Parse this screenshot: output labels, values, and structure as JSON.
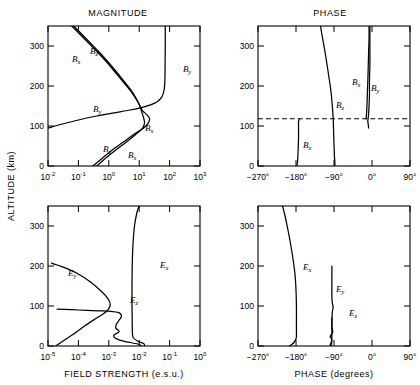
{
  "figure": {
    "panel_titles": {
      "magnitude": "MAGNITUDE",
      "phase": "PHASE"
    },
    "axis_titles": {
      "y": "ALTITUDE (km)",
      "x_left": "FIELD STRENGTH (e.s.u.)",
      "x_right": "PHASE (degrees)"
    },
    "y_ticks": [
      "0",
      "100",
      "200",
      "300"
    ],
    "x_ticks_magnitude_b": [
      "10",
      "-2",
      "10",
      "-1",
      "10",
      "0",
      "10",
      "1",
      "10",
      "2",
      "10",
      "3"
    ],
    "x_ticks_magnitude_e": [
      "10",
      "-5",
      "10",
      "-4",
      "10",
      "-3",
      "10",
      "-2",
      "10",
      "-1",
      "10",
      "0"
    ],
    "x_ticks_phase": [
      "−270°",
      "−180°",
      "−90°",
      "0°",
      "90°"
    ],
    "curve_labels": {
      "bx": "B",
      "bx_sub": "x",
      "by": "B",
      "by_sub": "y",
      "bz": "B",
      "bz_sub": "z",
      "ex": "E",
      "ex_sub": "x",
      "ey": "E",
      "ey_sub": "y",
      "ez": "E",
      "ez_sub": "z"
    },
    "colors": {
      "line": "#000000",
      "background": "#ffffff"
    }
  },
  "chart_data": [
    {
      "type": "line",
      "title": "MAGNITUDE",
      "panel": "b-field-magnitude",
      "xlabel": "FIELD STRENGTH (e.s.u.)",
      "ylabel": "ALTITUDE (km)",
      "xscale": "log",
      "xlim": [
        0.01,
        1000
      ],
      "ylim": [
        0,
        350
      ],
      "xtick_labels": [
        "10^-2",
        "10^-1",
        "10^0",
        "10^1",
        "10^2",
        "10^3"
      ],
      "ytick_labels": [
        "0",
        "100",
        "200",
        "300"
      ],
      "grid": false,
      "legend": "inline-annotations",
      "series": [
        {
          "name": "Bx",
          "points": [
            [
              0.3,
              0
            ],
            [
              0.62,
              20
            ],
            [
              1.3,
              40
            ],
            [
              3.0,
              60
            ],
            [
              7.0,
              80
            ],
            [
              14.0,
              95
            ],
            [
              20.0,
              108
            ],
            [
              22.0,
              118
            ],
            [
              18.0,
              128
            ],
            [
              13.0,
              138
            ],
            [
              11.0,
              148
            ],
            [
              9.0,
              160
            ],
            [
              5.5,
              185
            ],
            [
              3.0,
              210
            ],
            [
              1.6,
              235
            ],
            [
              0.85,
              260
            ],
            [
              0.42,
              285
            ],
            [
              0.2,
              310
            ],
            [
              0.095,
              335
            ],
            [
              0.06,
              350
            ]
          ]
        },
        {
          "name": "By",
          "points": [
            [
              0.01,
              95
            ],
            [
              0.03,
              105
            ],
            [
              0.1,
              115
            ],
            [
              0.4,
              125
            ],
            [
              1.5,
              133
            ],
            [
              5.0,
              140
            ],
            [
              12.0,
              146
            ],
            [
              22.0,
              152
            ],
            [
              38.0,
              160
            ],
            [
              55.0,
              172
            ],
            [
              66.0,
              190
            ],
            [
              70.0,
              215
            ],
            [
              71.0,
              250
            ],
            [
              72.0,
              300
            ],
            [
              72.0,
              350
            ]
          ]
        },
        {
          "name": "Bz",
          "points": [
            [
              0.4,
              0
            ],
            [
              0.8,
              20
            ],
            [
              1.7,
              40
            ],
            [
              3.8,
              60
            ],
            [
              8.0,
              80
            ],
            [
              13.0,
              95
            ],
            [
              15.0,
              108
            ],
            [
              14.0,
              120
            ],
            [
              12.5,
              132
            ],
            [
              11.0,
              145
            ],
            [
              9.5,
              158
            ],
            [
              6.0,
              185
            ],
            [
              3.3,
              210
            ],
            [
              1.8,
              235
            ],
            [
              0.95,
              260
            ],
            [
              0.48,
              285
            ],
            [
              0.23,
              310
            ],
            [
              0.11,
              335
            ],
            [
              0.07,
              350
            ]
          ]
        }
      ]
    },
    {
      "type": "line",
      "title": "PHASE",
      "panel": "b-field-phase",
      "xlabel": "PHASE (degrees)",
      "ylabel": "ALTITUDE (km)",
      "xscale": "linear",
      "xlim": [
        -270,
        90
      ],
      "ylim": [
        0,
        350
      ],
      "xtick_labels": [
        "-270",
        "-180",
        "-90",
        "0",
        "90"
      ],
      "ytick_labels": [
        "0",
        "100",
        "200",
        "300"
      ],
      "grid": false,
      "series": [
        {
          "name": "Bx",
          "points": [
            [
              -178,
              0
            ],
            [
              -177,
              6
            ],
            [
              -176,
              14
            ],
            [
              -175,
              40
            ],
            [
              -174,
              70
            ],
            [
              -174,
              100
            ],
            [
              -174,
              112
            ],
            [
              -172,
              116
            ]
          ],
          "note": "lower branch, terminates at dashed discontinuity near 118 km"
        },
        {
          "name": "Bx-upper",
          "points": [
            [
              -14,
              118
            ],
            [
              -13,
              130
            ],
            [
              -12,
              150
            ],
            [
              -11,
              180
            ],
            [
              -10,
              210
            ],
            [
              -9,
              245
            ],
            [
              -8,
              285
            ],
            [
              -7,
              320
            ],
            [
              -7,
              350
            ]
          ]
        },
        {
          "name": "By",
          "points": [
            [
              -8,
              95
            ],
            [
              -9,
              105
            ],
            [
              -10,
              112
            ],
            [
              -9,
              120
            ],
            [
              -8,
              130
            ],
            [
              -7,
              150
            ],
            [
              -6,
              180
            ],
            [
              -6,
              215
            ],
            [
              -5,
              255
            ],
            [
              -5,
              300
            ],
            [
              -5,
              350
            ]
          ]
        },
        {
          "name": "Bz",
          "points": [
            [
              -88,
              0
            ],
            [
              -88,
              10
            ],
            [
              -89,
              25
            ],
            [
              -90,
              55
            ],
            [
              -91,
              90
            ],
            [
              -92,
              120
            ],
            [
              -94,
              150
            ],
            [
              -97,
              185
            ],
            [
              -101,
              215
            ],
            [
              -106,
              250
            ],
            [
              -112,
              290
            ],
            [
              -118,
              325
            ],
            [
              -122,
              350
            ]
          ]
        },
        {
          "name": "discontinuity",
          "style": "dashed",
          "points": [
            [
              -270,
              118
            ],
            [
              90,
              118
            ]
          ]
        }
      ]
    },
    {
      "type": "line",
      "title": "MAGNITUDE",
      "panel": "e-field-magnitude",
      "xlabel": "FIELD STRENGTH (e.s.u.)",
      "ylabel": "ALTITUDE (km)",
      "xscale": "log",
      "xlim": [
        1e-05,
        1
      ],
      "ylim": [
        0,
        350
      ],
      "xtick_labels": [
        "10^-5",
        "10^-4",
        "10^-3",
        "10^-2",
        "10^-1",
        "10^0"
      ],
      "ytick_labels": [
        "0",
        "100",
        "200",
        "300"
      ],
      "grid": false,
      "series": [
        {
          "name": "Ex",
          "points": [
            [
              0.015,
              0
            ],
            [
              0.014,
              6
            ],
            [
              0.009,
              12
            ],
            [
              0.0065,
              20
            ],
            [
              0.006,
              30
            ],
            [
              0.0059,
              60
            ],
            [
              0.0058,
              100
            ],
            [
              0.0058,
              150
            ],
            [
              0.0059,
              200
            ],
            [
              0.0062,
              250
            ],
            [
              0.007,
              300
            ],
            [
              0.0085,
              335
            ],
            [
              0.01,
              350
            ]
          ]
        },
        {
          "name": "Ey",
          "points": [
            [
              1.8e-05,
              0
            ],
            [
              3.5e-05,
              15
            ],
            [
              7e-05,
              30
            ],
            [
              0.00016,
              50
            ],
            [
              0.0004,
              70
            ],
            [
              0.0008,
              85
            ],
            [
              0.0011,
              100
            ],
            [
              0.001,
              115
            ],
            [
              0.0006,
              135
            ],
            [
              0.00025,
              160
            ],
            [
              9e-05,
              182
            ],
            [
              3e-05,
              198
            ],
            [
              1.3e-05,
              207
            ]
          ]
        },
        {
          "name": "Ez",
          "points": [
            [
              0.012,
              0
            ],
            [
              0.009,
              5
            ],
            [
              0.003,
              12
            ],
            [
              0.0016,
              20
            ],
            [
              0.0015,
              28
            ],
            [
              0.0022,
              36
            ],
            [
              0.0017,
              45
            ],
            [
              0.0018,
              55
            ],
            [
              0.0022,
              65
            ],
            [
              0.0026,
              75
            ],
            [
              0.002,
              84
            ],
            [
              0.0006,
              88
            ],
            [
              0.0001,
              90
            ],
            [
              2e-05,
              92
            ]
          ]
        }
      ]
    },
    {
      "type": "line",
      "title": "PHASE",
      "panel": "e-field-phase",
      "xlabel": "PHASE (degrees)",
      "ylabel": "ALTITUDE (km)",
      "xscale": "linear",
      "xlim": [
        -270,
        90
      ],
      "ylim": [
        0,
        350
      ],
      "xtick_labels": [
        "-270",
        "-180",
        "-90",
        "0",
        "90"
      ],
      "ytick_labels": [
        "0",
        "100",
        "200",
        "300"
      ],
      "grid": false,
      "series": [
        {
          "name": "Ex",
          "points": [
            [
              -196,
              0
            ],
            [
              -190,
              4
            ],
            [
              -184,
              10
            ],
            [
              -180,
              18
            ],
            [
              -179,
              25
            ],
            [
              -179,
              60
            ],
            [
              -179,
              100
            ],
            [
              -180,
              140
            ],
            [
              -182,
              175
            ],
            [
              -186,
              210
            ],
            [
              -192,
              250
            ],
            [
              -199,
              290
            ],
            [
              -207,
              330
            ],
            [
              -212,
              350
            ]
          ]
        },
        {
          "name": "Ey",
          "points": [
            [
              -100,
              0
            ],
            [
              -98,
              5
            ],
            [
              -96,
              12
            ],
            [
              -95,
              25
            ],
            [
              -95,
              45
            ],
            [
              -95,
              65
            ],
            [
              -94,
              85
            ],
            [
              -92,
              97
            ],
            [
              -94,
              108
            ],
            [
              -95,
              125
            ],
            [
              -95,
              155
            ],
            [
              -95,
              180
            ],
            [
              -95,
              200
            ]
          ]
        },
        {
          "name": "Ez",
          "points": [
            [
              -97,
              0
            ],
            [
              -96,
              6
            ],
            [
              -95,
              12
            ],
            [
              -96,
              18
            ],
            [
              -99,
              24
            ],
            [
              -95,
              30
            ],
            [
              -93,
              36
            ],
            [
              -94,
              42
            ],
            [
              -95,
              50
            ],
            [
              -95,
              60
            ],
            [
              -94,
              70
            ]
          ]
        }
      ]
    }
  ]
}
